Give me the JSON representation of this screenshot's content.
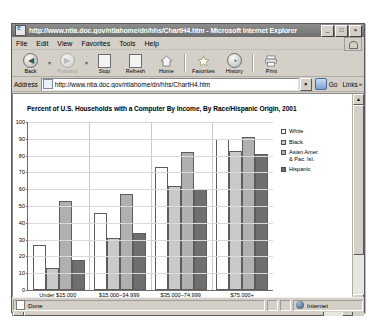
{
  "window": {
    "title": "http://www.ntia.doc.gov/ntiahome/dn/hhs/ChartH4.htm - Microsoft Internet Explorer",
    "minimize_label": "_",
    "maximize_label": "□",
    "close_label": "×"
  },
  "menu": {
    "items": [
      {
        "label": "File"
      },
      {
        "label": "Edit"
      },
      {
        "label": "View"
      },
      {
        "label": "Favorites"
      },
      {
        "label": "Tools"
      },
      {
        "label": "Help"
      }
    ]
  },
  "toolbar": {
    "buttons": [
      {
        "label": "Back",
        "icon": "back-arrow-icon",
        "glyph": "◀",
        "disabled": false
      },
      {
        "label": "Forward",
        "icon": "forward-arrow-icon",
        "glyph": "▶",
        "disabled": true
      },
      {
        "label": "Stop",
        "icon": "stop-icon",
        "glyph": "",
        "disabled": false
      },
      {
        "label": "Refresh",
        "icon": "refresh-icon",
        "glyph": "",
        "disabled": false
      },
      {
        "label": "Home",
        "icon": "home-icon",
        "glyph": "",
        "disabled": false
      },
      {
        "label": "Favorites",
        "icon": "star-icon",
        "glyph": "★",
        "disabled": false
      },
      {
        "label": "History",
        "icon": "history-clock-icon",
        "glyph": "◔",
        "disabled": false
      },
      {
        "label": "Print",
        "icon": "printer-icon",
        "glyph": "",
        "disabled": false
      }
    ]
  },
  "address": {
    "label": "Address",
    "value": "http://www.ntia.doc.gov/ntiahome/dn/hhs/ChartH4.htm",
    "placeholder": "",
    "go_label": "Go",
    "links_label": "Links",
    "links_chevron": "»",
    "dropdown_glyph": "▼"
  },
  "status": {
    "text": "Done",
    "zone": "Internet"
  },
  "chart_data": {
    "type": "bar",
    "title": "Percent of U.S. Households with a Computer By Income, By Race/Hispanic Origin, 2001",
    "xlabel": "",
    "ylabel": "",
    "ylim": [
      0,
      100
    ],
    "ytick_step": 10,
    "yticks": [
      100,
      90,
      80,
      70,
      60,
      50,
      40,
      30,
      20,
      10,
      0
    ],
    "grid": true,
    "legend_position": "right",
    "categories": [
      "Under $15,000",
      "$15,000–34,999",
      "$35,000–74,999",
      "$75,000+"
    ],
    "series": [
      {
        "name": "White",
        "values": [
          27,
          46,
          73,
          90
        ]
      },
      {
        "name": "Black",
        "values": [
          13,
          31,
          62,
          83
        ]
      },
      {
        "name": "Asian Amer.\n& Pac. Isl.",
        "values": [
          53,
          57,
          82,
          91
        ]
      },
      {
        "name": "Hispanic",
        "values": [
          18,
          34,
          60,
          81
        ]
      }
    ]
  }
}
